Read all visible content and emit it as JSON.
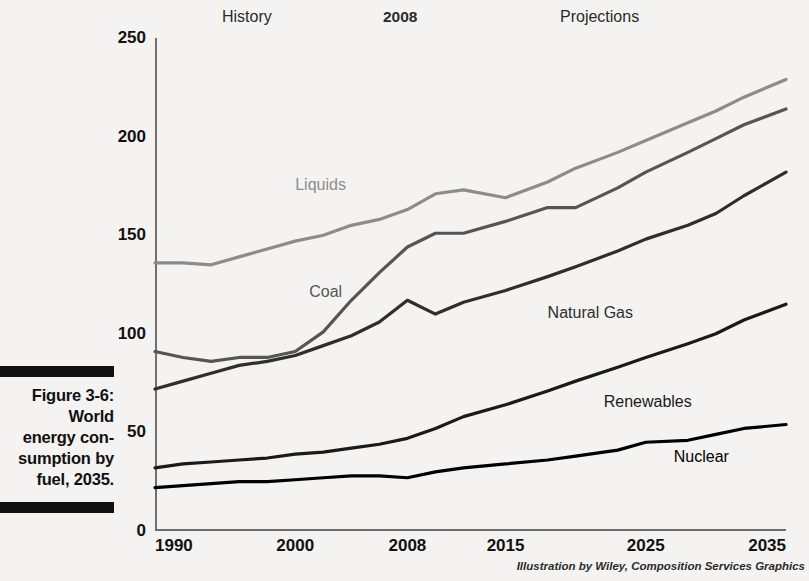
{
  "caption": {
    "figure_number": "Figure 3-6:",
    "lines": [
      "World",
      "energy con-",
      "sumption by",
      "fuel, 2035."
    ]
  },
  "credit": "Illustration by Wiley, Composition Services Graphics",
  "bands": {
    "history": "History",
    "divider_year": "2008",
    "projections": "Projections"
  },
  "colors": {
    "liquids": "#8c8c8c",
    "coal": "#555555",
    "natural_gas": "#2e2e2e",
    "renewables": "#1a1a1a",
    "nuclear": "#000000",
    "axis": "#6f6f6f",
    "background": "#f4f3f1"
  },
  "chart_data": {
    "type": "line",
    "xlabel": "",
    "ylabel": "",
    "unit": "quadrillion Btu",
    "grid": false,
    "legend": "inline-labels",
    "xlim": [
      1990,
      2035
    ],
    "ylim": [
      0,
      250
    ],
    "yticks": [
      0,
      50,
      100,
      150,
      200,
      250
    ],
    "xticks": [
      1990,
      2000,
      2008,
      2015,
      2025,
      2035
    ],
    "xtick_labels": [
      "1990",
      "2000",
      "2008",
      "2015",
      "2025",
      "2035"
    ],
    "ytick_labels": [
      "0",
      "50",
      "100",
      "150",
      "200",
      "250"
    ],
    "x": [
      1990,
      1992,
      1994,
      1996,
      1998,
      2000,
      2002,
      2004,
      2006,
      2008,
      2010,
      2012,
      2015,
      2018,
      2020,
      2023,
      2025,
      2028,
      2030,
      2032,
      2035
    ],
    "series": [
      {
        "name": "Liquids",
        "color": "#8c8c8c",
        "label_x": 2000,
        "label_y": 180,
        "values": [
          136,
          136,
          135,
          139,
          143,
          147,
          150,
          155,
          158,
          163,
          171,
          173,
          169,
          177,
          184,
          192,
          198,
          207,
          213,
          220,
          229
        ]
      },
      {
        "name": "Coal",
        "color": "#555555",
        "label_x": 2001,
        "label_y": 126,
        "values": [
          91,
          88,
          86,
          88,
          88,
          91,
          101,
          117,
          131,
          144,
          151,
          151,
          157,
          164,
          164,
          174,
          182,
          192,
          199,
          206,
          214
        ]
      },
      {
        "name": "Natural Gas",
        "color": "#2e2e2e",
        "label_x": 2018,
        "label_y": 115,
        "values": [
          72,
          76,
          80,
          84,
          86,
          89,
          94,
          99,
          106,
          117,
          110,
          116,
          122,
          129,
          134,
          142,
          148,
          155,
          161,
          170,
          182
        ]
      },
      {
        "name": "Renewables",
        "color": "#1a1a1a",
        "label_x": 2022,
        "label_y": 70,
        "values": [
          32,
          34,
          35,
          36,
          37,
          39,
          40,
          42,
          44,
          47,
          52,
          58,
          64,
          71,
          76,
          83,
          88,
          95,
          100,
          107,
          115
        ]
      },
      {
        "name": "Nuclear",
        "color": "#000000",
        "label_x": 2027,
        "label_y": 42,
        "values": [
          22,
          23,
          24,
          25,
          25,
          26,
          27,
          28,
          28,
          27,
          30,
          32,
          34,
          36,
          38,
          41,
          45,
          46,
          49,
          52,
          54
        ]
      }
    ]
  }
}
